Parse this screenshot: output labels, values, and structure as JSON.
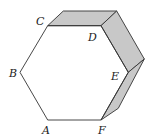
{
  "diagram": {
    "colors": {
      "face_fill": "#c8c8c8",
      "stroke": "#333333",
      "background": "#ffffff"
    },
    "vertices": {
      "A": {
        "label": "A",
        "x": 47.7,
        "y": 120
      },
      "B": {
        "label": "B",
        "x": 20,
        "y": 72.3
      },
      "C": {
        "label": "C",
        "x": 47.7,
        "y": 25.7
      },
      "D": {
        "label": "D",
        "x": 101,
        "y": 25.7
      },
      "E": {
        "label": "E",
        "x": 128.3,
        "y": 72.3
      },
      "F": {
        "label": "F",
        "x": 101,
        "y": 120
      }
    },
    "labels": [
      "A",
      "B",
      "C",
      "D",
      "E",
      "F"
    ],
    "shaded_faces": [
      "top face C-D",
      "upper right face D-E",
      "lower right face E-F"
    ]
  }
}
